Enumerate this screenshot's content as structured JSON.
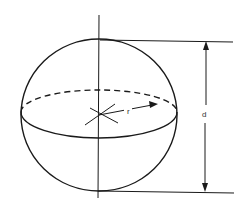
{
  "diagram": {
    "labels": {
      "radius": "r",
      "diameter": "d"
    },
    "colors": {
      "stroke": "#1a1a1a",
      "background": "#ffffff"
    }
  }
}
